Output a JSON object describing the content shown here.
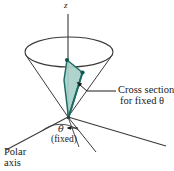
{
  "figure": {
    "background_color": "#ffffff",
    "line_color": "#3a3a3a",
    "cross_section_fill": "#a8cfc9",
    "cross_section_stroke": "#1d6b63"
  },
  "labels": {
    "z_axis": "z",
    "cross_section_line1": "Cross section",
    "cross_section_line2": "for fixed θ",
    "theta": "θ",
    "fixed": "(fixed)",
    "polar_axis_line1": "Polar",
    "polar_axis_line2": "axis"
  },
  "geometry": {
    "apex": [
      68,
      117
    ],
    "z_axis_top": [
      68,
      14
    ],
    "ellipse_center": [
      69,
      52
    ],
    "ellipse_rx": 44,
    "ellipse_ry": 15,
    "cross_section_vertices": [
      [
        67,
        60
      ],
      [
        82,
        72
      ],
      [
        68,
        117
      ]
    ],
    "polar_axis_ray_end": [
      6,
      150
    ],
    "right_ray_end": [
      166,
      146
    ],
    "mid_ray_end": [
      95,
      150
    ],
    "short_ray_end": [
      77,
      145
    ],
    "theta_arc_radius": 30
  }
}
